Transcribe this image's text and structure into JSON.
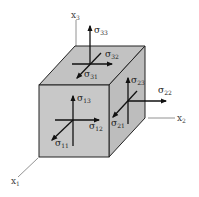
{
  "diagram": {
    "type": "stress-tensor-cube",
    "colors": {
      "face_front": "#c8c8c8",
      "face_top": "#c2c2c2",
      "face_right": "#bdbdbd",
      "edge": "#222222",
      "axis": "#777777",
      "arrow": "#111111"
    },
    "axes": [
      {
        "id": "x1",
        "base": "x",
        "sub": "1"
      },
      {
        "id": "x2",
        "base": "x",
        "sub": "2"
      },
      {
        "id": "x3",
        "base": "x",
        "sub": "3"
      }
    ],
    "faces": {
      "front": {
        "normal": "x1",
        "components": [
          {
            "base": "σ",
            "sub": "11"
          },
          {
            "base": "σ",
            "sub": "12"
          },
          {
            "base": "σ",
            "sub": "13"
          }
        ]
      },
      "right": {
        "normal": "x2",
        "components": [
          {
            "base": "σ",
            "sub": "21"
          },
          {
            "base": "σ",
            "sub": "22"
          },
          {
            "base": "σ",
            "sub": "23"
          }
        ]
      },
      "top": {
        "normal": "x3",
        "components": [
          {
            "base": "σ",
            "sub": "31"
          },
          {
            "base": "σ",
            "sub": "32"
          },
          {
            "base": "σ",
            "sub": "33"
          }
        ]
      }
    }
  }
}
